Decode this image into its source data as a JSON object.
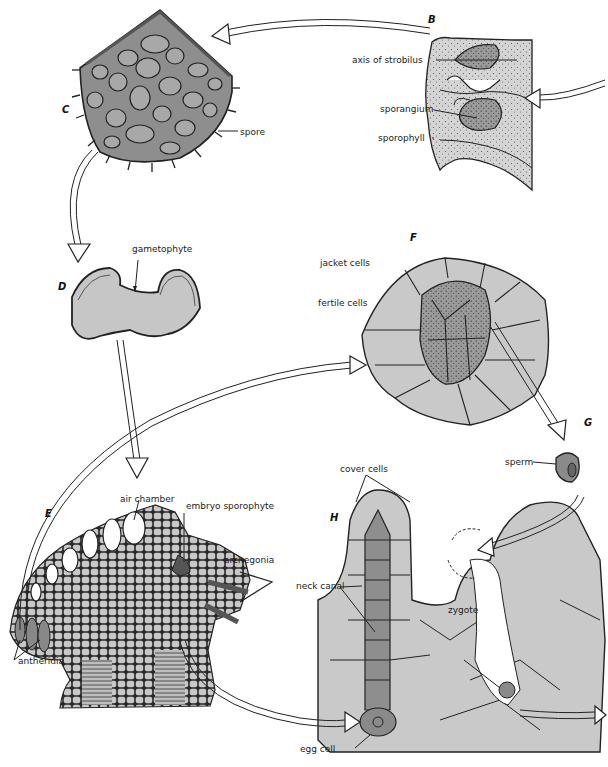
{
  "figure": {
    "colors": {
      "tissue": "#c9c9c9",
      "dark_tissue": "#8a8a8a",
      "outline": "#222222",
      "stipple": "#777777"
    }
  },
  "panels": {
    "B": {
      "letter": "B",
      "labels": [
        "axis of strobilus",
        "sporangium",
        "sporophyll"
      ]
    },
    "C": {
      "letter": "C",
      "labels": [
        "spore"
      ]
    },
    "D": {
      "letter": "D",
      "labels": [
        "gametophyte"
      ]
    },
    "E": {
      "letter": "E",
      "labels": [
        "air chamber",
        "embryo sporophyte",
        "archegonia",
        "antheridia"
      ]
    },
    "F": {
      "letter": "F",
      "labels": [
        "jacket cells",
        "fertile cells"
      ]
    },
    "G": {
      "letter": "G",
      "labels": [
        "sperm"
      ]
    },
    "H": {
      "letter": "H",
      "labels": [
        "cover cells",
        "neck canal",
        "zygote",
        "egg cell"
      ]
    }
  }
}
